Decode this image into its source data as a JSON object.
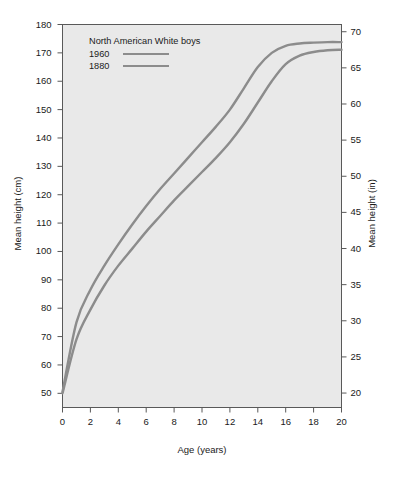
{
  "chart_data": {
    "type": "line",
    "title": "",
    "xlabel": "Age (years)",
    "ylabel": "Mean height (cm)",
    "ylabel_right": "Mean height (in)",
    "xlim": [
      0,
      20
    ],
    "ylim": [
      45,
      180
    ],
    "ylim_right": [
      18,
      71
    ],
    "grid": false,
    "legend_position": "top-left",
    "legend_title": "North American White boys",
    "xticks": [
      0,
      2,
      4,
      6,
      8,
      10,
      12,
      14,
      16,
      18,
      20
    ],
    "yticks": [
      50,
      60,
      70,
      80,
      90,
      100,
      110,
      120,
      130,
      140,
      150,
      160,
      170,
      180
    ],
    "yticks_right": [
      20,
      25,
      30,
      35,
      40,
      45,
      50,
      55,
      60,
      65,
      70
    ],
    "line_color": "#8c8c8c",
    "plot_background": "#e9e9e9",
    "x": [
      0,
      1,
      2,
      3,
      4,
      5,
      6,
      7,
      8,
      9,
      10,
      11,
      12,
      13,
      14,
      15,
      16,
      17,
      18,
      19,
      20
    ],
    "series": [
      {
        "name": "1960",
        "values": [
          50.5,
          75.0,
          86.5,
          95.0,
          102.5,
          109.5,
          116.0,
          122.0,
          127.5,
          133.0,
          138.5,
          144.0,
          150.0,
          157.5,
          165.0,
          170.0,
          172.5,
          173.3,
          173.6,
          173.8,
          173.8
        ]
      },
      {
        "name": "1880",
        "values": [
          50.0,
          69.0,
          79.5,
          88.0,
          95.0,
          101.0,
          107.0,
          112.5,
          118.0,
          123.0,
          128.0,
          133.0,
          138.5,
          145.0,
          152.5,
          160.0,
          166.0,
          169.0,
          170.3,
          170.9,
          171.1
        ]
      }
    ]
  }
}
